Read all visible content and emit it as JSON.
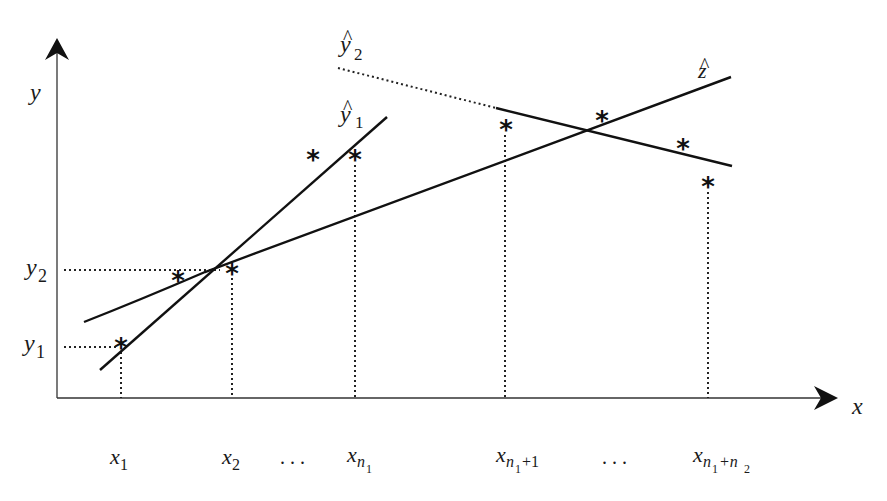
{
  "diagram": {
    "type": "regression-lines-schematic",
    "axes": {
      "x_label": "x",
      "y_label": "y"
    },
    "y_ticks": [
      {
        "base": "y",
        "sub": "2"
      },
      {
        "base": "y",
        "sub": "1"
      }
    ],
    "x_ticks": [
      {
        "base": "x",
        "sub": "1"
      },
      {
        "base": "x",
        "sub": "2"
      },
      {
        "dots": ". . ."
      },
      {
        "base": "x",
        "sub": "n",
        "subsub": "1"
      },
      {
        "base": "x",
        "sub": "n",
        "subsub": "1",
        "tail": "+1"
      },
      {
        "dots": ". . ."
      },
      {
        "base": "x",
        "sub": "n",
        "subsub": "1",
        "tail": "+n",
        "tailsub": "2"
      }
    ],
    "lines": [
      {
        "name": "y-hat-1",
        "label_base": "y",
        "label_sub": "1",
        "hat": "^"
      },
      {
        "name": "y-hat-2",
        "label_base": "y",
        "label_sub": "2",
        "hat": "^"
      },
      {
        "name": "z-hat",
        "label_base": "z",
        "hat": "^"
      }
    ],
    "point_marker": "*",
    "points_count": 9
  }
}
